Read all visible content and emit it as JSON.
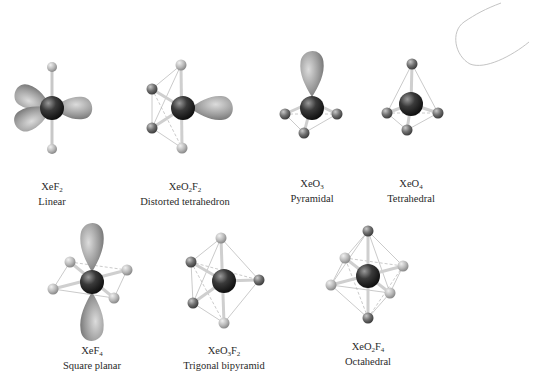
{
  "figure": {
    "molecules": [
      {
        "id": "xef2",
        "formula_parts": [
          "XeF",
          "2"
        ],
        "formula": "XeF2",
        "geometry": "Linear",
        "cx": 52,
        "cy": 108,
        "label_x": 52,
        "label_y": 187
      },
      {
        "id": "xeo2f2",
        "formula_parts": [
          "XeO",
          "2",
          "F",
          "2"
        ],
        "formula": "XeO2F2",
        "geometry": "Distorted tetrahedron",
        "cx": 183,
        "cy": 108,
        "label_x": 185,
        "label_y": 187
      },
      {
        "id": "xeo3",
        "formula_parts": [
          "XeO",
          "3"
        ],
        "formula": "XeO3",
        "geometry": "Pyramidal",
        "cx": 312,
        "cy": 108,
        "label_x": 312,
        "label_y": 183
      },
      {
        "id": "xeo4",
        "formula_parts": [
          "XeO",
          "4"
        ],
        "formula": "XeO4",
        "geometry": "Tetrahedral",
        "cx": 411,
        "cy": 104,
        "label_x": 411,
        "label_y": 183
      },
      {
        "id": "xef4",
        "formula_parts": [
          "XeF",
          "4"
        ],
        "formula": "XeF4",
        "geometry": "Square planar",
        "cx": 92,
        "cy": 282,
        "label_x": 92,
        "label_y": 350
      },
      {
        "id": "xeo3f2",
        "formula_parts": [
          "XeO",
          "3",
          "F",
          "2"
        ],
        "formula": "XeO3F2",
        "geometry": "Trigonal bipyramid",
        "cx": 224,
        "cy": 281,
        "label_x": 224,
        "label_y": 350
      },
      {
        "id": "xeo2f4",
        "formula_parts": [
          "XeO",
          "2",
          "F",
          "4"
        ],
        "formula": "XeO2F4",
        "geometry": "Octahedral",
        "cx": 368,
        "cy": 276,
        "label_x": 368,
        "label_y": 346
      }
    ],
    "colors": {
      "xenon_dark": "#1e1e1e",
      "oxygen": "#6f6f6f",
      "fluorine": "#b5b5b5",
      "lone_pair": "#9a9a9a",
      "bond_line": "#bdbdbd",
      "label_text": "#2a2a2a"
    }
  }
}
